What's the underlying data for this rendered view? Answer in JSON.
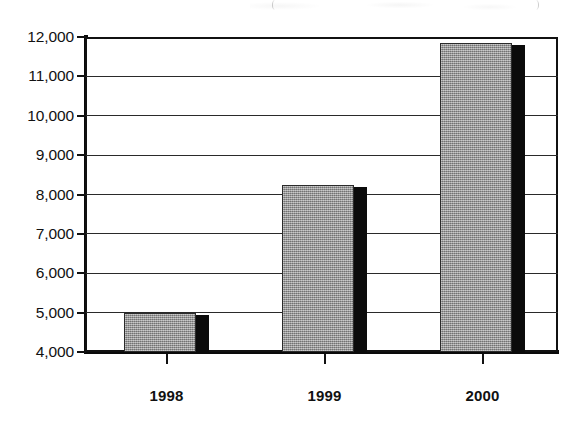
{
  "chart_data": {
    "type": "bar",
    "title": "",
    "xlabel": "",
    "ylabel": "",
    "categories": [
      "1998",
      "1999",
      "2000"
    ],
    "values": [
      5000,
      8230,
      11850
    ],
    "series": [
      {
        "name": "",
        "values": [
          5000,
          8230,
          11850
        ]
      }
    ],
    "ylim": [
      4000,
      12000
    ],
    "ytick_values": [
      12000,
      11000,
      10000,
      9000,
      8000,
      7000,
      6000,
      5000,
      4000
    ],
    "ytick_labels": [
      "12,000",
      "11,000",
      "10,000",
      "9,000",
      "8,000",
      "7,000",
      "6,000",
      "5,000",
      "4,000"
    ],
    "xtick_labels": [
      "1998",
      "1999",
      "2000"
    ],
    "grid": true,
    "grid_axis": "y",
    "legend": false,
    "legend_position": "none",
    "bar_fill_color": "#9c9c9c",
    "bar_edge_color": "#2b2b2b",
    "bar_shadow_color": "#0b0b0b",
    "axis_color": "#111111",
    "background_color": "#ffffff",
    "annotations": []
  },
  "axes": {
    "y_labels": [
      {
        "text": "12,000",
        "value": 12000
      },
      {
        "text": "11,000",
        "value": 11000
      },
      {
        "text": "10,000",
        "value": 10000
      },
      {
        "text": "9,000",
        "value": 9000
      },
      {
        "text": "8,000",
        "value": 8000
      },
      {
        "text": "7,000",
        "value": 7000
      },
      {
        "text": "6,000",
        "value": 6000
      },
      {
        "text": "5,000",
        "value": 5000
      },
      {
        "text": "4,000",
        "value": 4000
      }
    ],
    "x_labels": [
      {
        "text": "1998"
      },
      {
        "text": "1999"
      },
      {
        "text": "2000"
      }
    ]
  }
}
